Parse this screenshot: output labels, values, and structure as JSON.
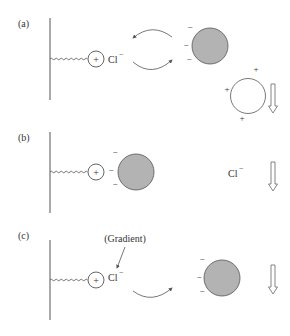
{
  "colors": {
    "stroke": "#555555",
    "particle_fill": "#b3b3b3",
    "background": "#ffffff"
  },
  "panels": [
    {
      "id": "a",
      "label": "(a)",
      "counterion": "Cl",
      "counterion_charge": "−",
      "fixed_charge": "+",
      "particle_charges": [
        "−",
        "−",
        "−"
      ],
      "positive_particle_charges": [
        "+",
        "+",
        "+"
      ]
    },
    {
      "id": "b",
      "label": "(b)",
      "counterion": "Cl",
      "counterion_charge": "−",
      "fixed_charge": "+",
      "particle_charges": [
        "−",
        "−",
        "−"
      ]
    },
    {
      "id": "c",
      "label": "(c)",
      "counterion": "Cl",
      "counterion_charge": "−",
      "fixed_charge": "+",
      "particle_charges": [
        "−",
        "−",
        "−"
      ],
      "annotation": "(Gradient)"
    }
  ]
}
